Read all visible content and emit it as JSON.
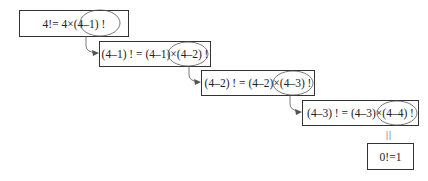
{
  "diagram": {
    "steps": [
      {
        "id": "step-1",
        "text": "4!= 4×(4–1) !",
        "circled": "(4–1) !"
      },
      {
        "id": "step-2",
        "text": "(4–1) ! = (4–1)×(4–2) !",
        "circled": "(4–2) !"
      },
      {
        "id": "step-3",
        "text": "(4–2) ! = (4–2)×(4–3) !",
        "circled": "(4–3) !"
      },
      {
        "id": "step-4",
        "text": "(4–3) ! = (4–3)×(4–4) !",
        "circled": "(4–4) !"
      }
    ],
    "base_case": {
      "text": "0!=1",
      "connector": "||"
    },
    "colors": {
      "stroke": "#333333",
      "background": "#ffffff",
      "text": "#222222"
    }
  }
}
